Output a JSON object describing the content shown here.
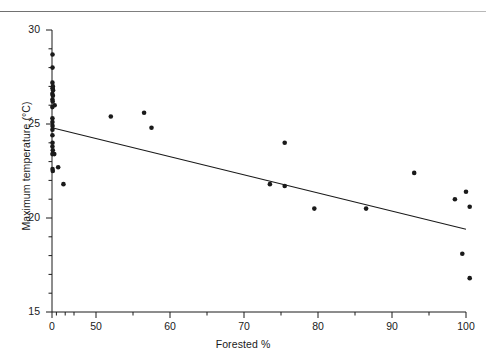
{
  "figure": {
    "top_rule": true,
    "background": "#ffffff",
    "ink": "#1a1a1a"
  },
  "chart_data": {
    "type": "scatter",
    "title": "",
    "xlabel": "Forested %",
    "ylabel": "Maximum temperature (°C)",
    "xlim": [
      0,
      100
    ],
    "ylim": [
      15,
      30
    ],
    "grid": false,
    "legend": "none",
    "x_axis_broken": true,
    "x_axis_note": "Axis compressed between 0 and 50; ticks shown at 0, 50, 60, 70, 80, 90, 100",
    "xticks": [
      0,
      50,
      60,
      70,
      80,
      90,
      100
    ],
    "xtick_labels": [
      "0",
      "50",
      "60",
      "70",
      "80",
      "90",
      "100"
    ],
    "x_minor_ticks": [
      5,
      15,
      25,
      55,
      65,
      75,
      85,
      95
    ],
    "yticks": [
      15,
      20,
      25,
      30
    ],
    "ytick_labels": [
      "15",
      "20",
      "25",
      "30"
    ],
    "y_minor_ticks": [
      16,
      17,
      18,
      19,
      21,
      22,
      23,
      24,
      26,
      27,
      28,
      29
    ],
    "marker": {
      "shape": "circle",
      "color": "#1a1a1a",
      "size_px": 4.6
    },
    "points": [
      {
        "x": 0.6,
        "y": 28.7
      },
      {
        "x": 0.6,
        "y": 28.0
      },
      {
        "x": 0.5,
        "y": 27.2
      },
      {
        "x": 1.0,
        "y": 27.0
      },
      {
        "x": 0.6,
        "y": 26.9
      },
      {
        "x": 1.2,
        "y": 26.8
      },
      {
        "x": 0.4,
        "y": 26.6
      },
      {
        "x": 1.0,
        "y": 26.5
      },
      {
        "x": 0.5,
        "y": 26.3
      },
      {
        "x": 0.8,
        "y": 26.2
      },
      {
        "x": 0.4,
        "y": 25.9
      },
      {
        "x": 3.0,
        "y": 26.0
      },
      {
        "x": 0.5,
        "y": 25.3
      },
      {
        "x": 0.5,
        "y": 25.1
      },
      {
        "x": 0.6,
        "y": 24.9
      },
      {
        "x": 0.5,
        "y": 24.7
      },
      {
        "x": 0.5,
        "y": 24.4
      },
      {
        "x": 0.6,
        "y": 24.0
      },
      {
        "x": 0.5,
        "y": 23.8
      },
      {
        "x": 0.9,
        "y": 23.6
      },
      {
        "x": 0.5,
        "y": 23.4
      },
      {
        "x": 2.6,
        "y": 23.4
      },
      {
        "x": 0.6,
        "y": 22.6
      },
      {
        "x": 0.9,
        "y": 22.5
      },
      {
        "x": 7.0,
        "y": 22.7
      },
      {
        "x": 13.0,
        "y": 21.8
      },
      {
        "x": 52.0,
        "y": 25.4
      },
      {
        "x": 56.5,
        "y": 25.6
      },
      {
        "x": 57.5,
        "y": 24.8
      },
      {
        "x": 75.5,
        "y": 24.0
      },
      {
        "x": 73.5,
        "y": 21.8
      },
      {
        "x": 75.5,
        "y": 21.7
      },
      {
        "x": 79.5,
        "y": 20.5
      },
      {
        "x": 86.5,
        "y": 20.5
      },
      {
        "x": 93.0,
        "y": 22.4
      },
      {
        "x": 98.5,
        "y": 21.0
      },
      {
        "x": 100.0,
        "y": 21.4
      },
      {
        "x": 100.5,
        "y": 20.6
      },
      {
        "x": 99.5,
        "y": 18.1
      },
      {
        "x": 100.5,
        "y": 16.8
      }
    ],
    "trend_line": {
      "type": "linear-regression",
      "x_start": 0,
      "y_start": 24.8,
      "x_end": 100,
      "y_end": 19.4,
      "color": "#1a1a1a"
    }
  }
}
